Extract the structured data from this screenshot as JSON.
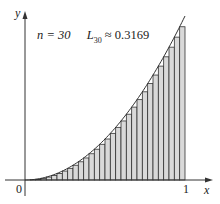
{
  "chart_data": {
    "type": "area",
    "title": "",
    "function": "y = x^2",
    "annotation": {
      "n_label": "n = 30",
      "L_label": "L",
      "L_sub": "30",
      "L_value": "≈ 0.3169"
    },
    "n": 30,
    "method": "left endpoint rectangles",
    "xlabel": "x",
    "ylabel": "y",
    "xlim": [
      0,
      1
    ],
    "ylim": [
      0,
      1
    ],
    "x_ticks": [
      "0",
      "1"
    ],
    "grid": false,
    "legend": "none",
    "colors": {
      "rect_fill": "#d9d9d9",
      "stroke": "#333333"
    }
  },
  "labels": {
    "y_axis": "y",
    "x_axis": "x",
    "origin": "0",
    "one": "1",
    "n_text": "n = 30",
    "L": "L",
    "L_sub": "30",
    "L_val": "≈ 0.3169"
  }
}
